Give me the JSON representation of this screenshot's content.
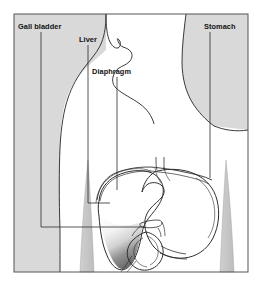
{
  "figure": {
    "frame": {
      "border_color": "#555555"
    },
    "background_color": "#ffffff",
    "body_fill": "#ffffff",
    "shade_fill": "#d9d9d9",
    "outline_color": "#3a3a3a",
    "label_color": "#111111",
    "leader_color": "#2b2b2b"
  },
  "labels": [
    {
      "id": "gall-bladder",
      "text": "Gall bladder",
      "x": 18,
      "y": 29,
      "anchor": "start",
      "leader_points": "41,32 41,227 145,227"
    },
    {
      "id": "liver",
      "text": "Liver",
      "x": 79,
      "y": 42,
      "anchor": "start",
      "leader_points": "88,45 88,203 110,203"
    },
    {
      "id": "diaphragm",
      "text": "Diaphragm",
      "x": 92,
      "y": 74,
      "anchor": "start",
      "leader_points": "117,77 117,190"
    },
    {
      "id": "stomach",
      "text": "Stomach",
      "x": 204,
      "y": 29,
      "anchor": "start",
      "leader_points": "210,32 210,178"
    }
  ],
  "organs": [
    {
      "id": "liver",
      "name": "Liver",
      "shading": "gradient-dark-lower-lobe"
    },
    {
      "id": "stomach",
      "name": "Stomach",
      "shading": "light-grey-curved-sac"
    },
    {
      "id": "gall-bladder",
      "name": "Gall bladder",
      "shading": "dark-wedge"
    },
    {
      "id": "duodenum",
      "name": "Duodenum",
      "shading": "light-loop"
    },
    {
      "id": "diaphragm",
      "name": "Diaphragm",
      "shading": "thin-arc"
    }
  ],
  "body_parts": [
    {
      "id": "head",
      "name": "Head and face profile"
    },
    {
      "id": "neck",
      "name": "Neck"
    },
    {
      "id": "torso",
      "name": "Torso"
    },
    {
      "id": "left-shoulder-shade",
      "name": "Left background shade"
    },
    {
      "id": "right-shoulder-shade",
      "name": "Right background shade"
    },
    {
      "id": "hip-bone-left",
      "name": "Left hip bone"
    },
    {
      "id": "hip-bone-right",
      "name": "Right hip bone"
    }
  ]
}
